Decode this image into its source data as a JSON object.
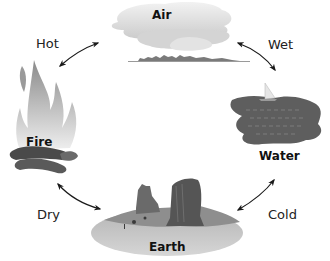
{
  "diagram": {
    "type": "cycle",
    "elements": [
      {
        "id": "air",
        "label": "Air",
        "icon": "cloud-icon"
      },
      {
        "id": "water",
        "label": "Water",
        "icon": "water-sailboat-icon"
      },
      {
        "id": "earth",
        "label": "Earth",
        "icon": "mesa-landscape-icon"
      },
      {
        "id": "fire",
        "label": "Fire",
        "icon": "flame-icon"
      }
    ],
    "qualities": [
      {
        "label": "Hot",
        "between": [
          "fire",
          "air"
        ]
      },
      {
        "label": "Wet",
        "between": [
          "air",
          "water"
        ]
      },
      {
        "label": "Cold",
        "between": [
          "water",
          "earth"
        ]
      },
      {
        "label": "Dry",
        "between": [
          "earth",
          "fire"
        ]
      }
    ],
    "arrows": "double-headed"
  },
  "colors": {
    "background": "#ffffff",
    "text": "#222222",
    "arrow": "#1a1a1a",
    "cloud": "#d9d9d9",
    "water": "#5e5e5e",
    "earth_ground": "#c8c8c8",
    "rock": "#5a5a5a",
    "fire": "#cfcfcf"
  }
}
